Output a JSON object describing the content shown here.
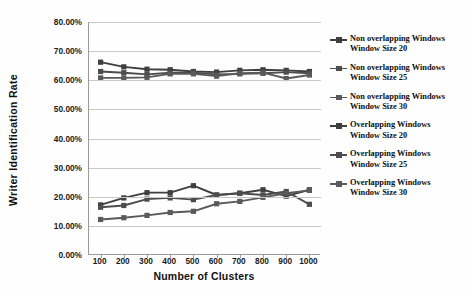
{
  "chart_data": {
    "type": "line",
    "title": "",
    "xlabel": "Number of Clusters",
    "ylabel": "Writer Identification Rate",
    "x": [
      100,
      200,
      300,
      400,
      500,
      600,
      700,
      800,
      900,
      1000
    ],
    "xticklabels": [
      "100",
      "200",
      "300",
      "400",
      "500",
      "600",
      "700",
      "800",
      "900",
      "1000"
    ],
    "yticklabels": [
      "0.00%",
      "10.00%",
      "20.00%",
      "30.00%",
      "40.00%",
      "50.00%",
      "60.00%",
      "70.00%",
      "80.00%"
    ],
    "ytickvalues": [
      0,
      10,
      20,
      30,
      40,
      50,
      60,
      70,
      80
    ],
    "ylim": [
      0,
      80
    ],
    "grid": "horizontal",
    "legend_position": "right",
    "series": [
      {
        "name": "Non overlapping Windows Window Size 20",
        "label_line1": "Non overlapping Windows",
        "label_line2": "Window Size 20",
        "color": "#3f3f3f",
        "values": [
          66.2,
          64.6,
          63.8,
          63.6,
          63.0,
          62.8,
          63.4,
          63.6,
          63.4,
          63.0
        ]
      },
      {
        "name": "Non overlapping Windows Window Size 25",
        "label_line1": "Non overlapping Windows",
        "label_line2": "Window Size 25",
        "color": "#4d4d4d",
        "values": [
          63.0,
          62.6,
          62.0,
          62.6,
          62.6,
          62.0,
          62.2,
          62.4,
          62.8,
          62.4
        ]
      },
      {
        "name": "Non overlapping Windows Window Size 30",
        "label_line1": "Non overlapping Windows",
        "label_line2": "Window Size 30",
        "color": "#5a5a5a",
        "values": [
          60.8,
          60.8,
          61.0,
          62.2,
          62.2,
          61.4,
          62.4,
          62.6,
          60.6,
          61.8
        ]
      },
      {
        "name": "Overlapping Windows Window Size 20",
        "label_line1": "Overlapping Windows",
        "label_line2": "Window Size 20",
        "color": "#3f3f3f",
        "values": [
          17.2,
          19.6,
          21.4,
          21.4,
          23.8,
          20.6,
          21.2,
          22.4,
          20.2,
          22.4
        ]
      },
      {
        "name": "Overlapping Windows Window Size 25",
        "label_line1": "Overlapping Windows",
        "label_line2": "Window Size 25",
        "color": "#4d4d4d",
        "values": [
          16.4,
          17.0,
          19.2,
          19.6,
          19.0,
          20.6,
          21.2,
          20.6,
          21.8,
          17.4
        ]
      },
      {
        "name": "Overlapping Windows Window Size 30",
        "label_line1": "Overlapping Windows",
        "label_line2": "Window Size 30",
        "color": "#5a5a5a",
        "values": [
          12.2,
          12.8,
          13.6,
          14.6,
          15.0,
          17.6,
          18.4,
          19.8,
          21.2,
          22.2
        ]
      }
    ]
  }
}
